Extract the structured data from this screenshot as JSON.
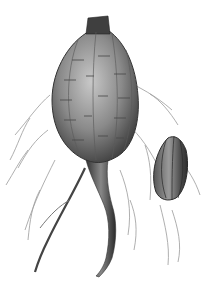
{
  "image": {
    "subject": "botanical illustration of a tuber with roots and a detached seed pod",
    "style": "engraving, grayscale",
    "elements": [
      "main tuber",
      "taproot",
      "fibrous roots",
      "ribbed oval pod"
    ],
    "colors": {
      "background": "#ffffff",
      "dark": "#3a3a3a",
      "mid": "#777777",
      "light": "#b5b5b5"
    }
  }
}
